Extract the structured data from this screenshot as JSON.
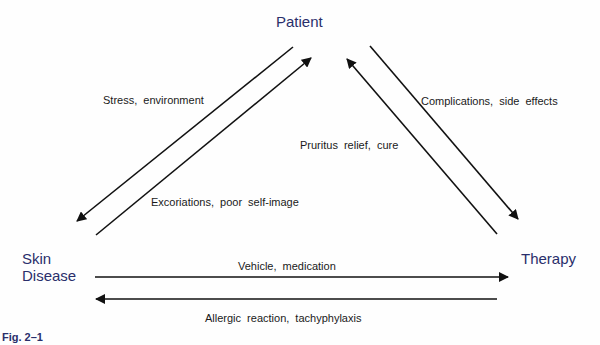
{
  "diagram": {
    "nodes": {
      "patient": "Patient",
      "skin_disease_line1": "Skin",
      "skin_disease_line2": "Disease",
      "therapy": "Therapy"
    },
    "edges": [
      {
        "from": "Patient",
        "to": "Skin Disease",
        "label": "Stress, environment"
      },
      {
        "from": "Skin Disease",
        "to": "Patient",
        "label": "Excoriations, poor self-image"
      },
      {
        "from": "Therapy",
        "to": "Patient",
        "label": "Pruritus relief, cure"
      },
      {
        "from": "Patient",
        "to": "Therapy",
        "label": "Complications, side effects"
      },
      {
        "from": "Skin Disease",
        "to": "Therapy",
        "label": "Vehicle, medication"
      },
      {
        "from": "Therapy",
        "to": "Skin Disease",
        "label": "Allergic reaction, tachyphylaxis"
      }
    ],
    "caption": "Fig. 2–1",
    "colors": {
      "node_text": "#2a2f6b",
      "arrow": "#111111",
      "label_text": "#1a1a1a"
    }
  }
}
